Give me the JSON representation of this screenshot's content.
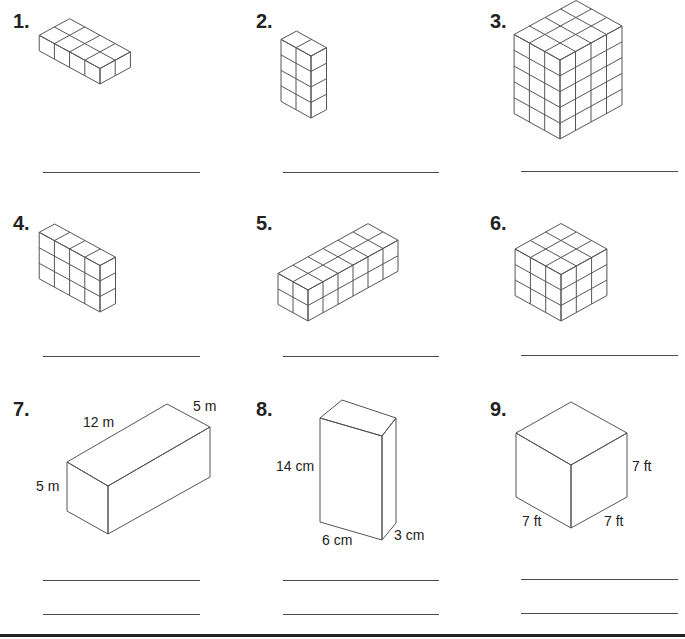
{
  "worksheet": {
    "problems": [
      {
        "number": "1.",
        "type": "unit-cubes",
        "cubes_length": 4,
        "cubes_width": 2,
        "cubes_height": 1
      },
      {
        "number": "2.",
        "type": "unit-cubes",
        "cubes_length": 2,
        "cubes_width": 1,
        "cubes_height": 4
      },
      {
        "number": "3.",
        "type": "unit-cubes",
        "cubes_length": 3,
        "cubes_width": 4,
        "cubes_height": 5
      },
      {
        "number": "4.",
        "type": "unit-cubes",
        "cubes_length": 4,
        "cubes_width": 1,
        "cubes_height": 3
      },
      {
        "number": "5.",
        "type": "unit-cubes",
        "cubes_length": 2,
        "cubes_width": 6,
        "cubes_height": 2
      },
      {
        "number": "6.",
        "type": "unit-cubes",
        "cubes_length": 3,
        "cubes_width": 3,
        "cubes_height": 3
      },
      {
        "number": "7.",
        "type": "rectangular-prism",
        "labels": {
          "length": "12 m",
          "width": "5 m",
          "height": "5 m"
        }
      },
      {
        "number": "8.",
        "type": "rectangular-prism",
        "labels": {
          "height": "14 cm",
          "length": "6 cm",
          "width": "3 cm"
        }
      },
      {
        "number": "9.",
        "type": "cube",
        "labels": {
          "height": "7 ft",
          "left_edge": "7 ft",
          "right_edge": "7 ft"
        }
      }
    ]
  }
}
